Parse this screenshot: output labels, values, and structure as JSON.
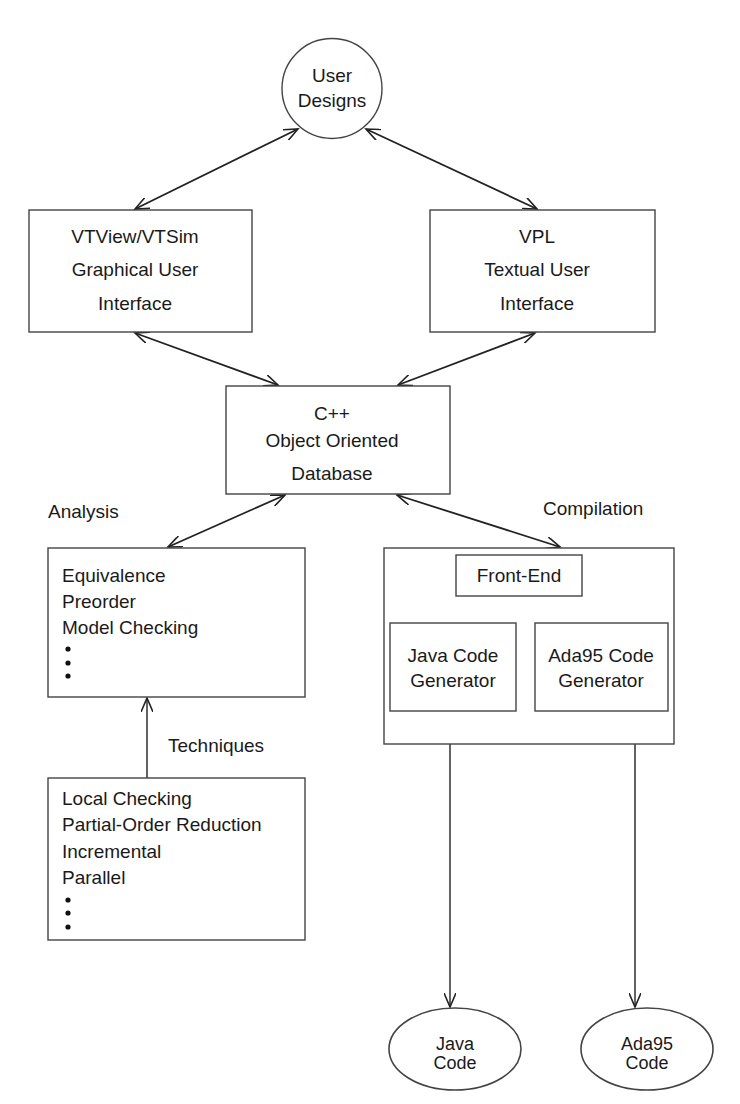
{
  "nodes": {
    "user_designs": {
      "lines": [
        "User",
        "Designs"
      ],
      "shape": "circle"
    },
    "gui": {
      "lines": [
        "VTView/VTSim",
        "Graphical User",
        "Interface"
      ],
      "shape": "box"
    },
    "tui": {
      "lines": [
        "VPL",
        "Textual User",
        "Interface"
      ],
      "shape": "box"
    },
    "database": {
      "lines": [
        "C++",
        "Object Oriented",
        "Database"
      ],
      "shape": "box"
    },
    "analysis": {
      "label": "Analysis",
      "items": [
        "Equivalence",
        "Preorder",
        "Model Checking"
      ],
      "ellipsis": true
    },
    "techniques": {
      "label": "Techniques",
      "items": [
        "Local Checking",
        "Partial-Order Reduction",
        "Incremental",
        "Parallel"
      ],
      "ellipsis": true
    },
    "compilation": {
      "label": "Compilation"
    },
    "front_end": {
      "lines": [
        "Front-End"
      ]
    },
    "java_gen": {
      "lines": [
        "Java Code",
        "Generator"
      ]
    },
    "ada_gen": {
      "lines": [
        "Ada95 Code",
        "Generator"
      ]
    },
    "java_code": {
      "lines": [
        "Java",
        "Code"
      ],
      "shape": "ellipse"
    },
    "ada_code": {
      "lines": [
        "Ada95",
        "Code"
      ],
      "shape": "ellipse"
    }
  },
  "edges": [
    {
      "from": "user_designs",
      "to": "gui",
      "type": "bidirectional"
    },
    {
      "from": "user_designs",
      "to": "tui",
      "type": "bidirectional"
    },
    {
      "from": "gui",
      "to": "database",
      "type": "bidirectional"
    },
    {
      "from": "tui",
      "to": "database",
      "type": "bidirectional"
    },
    {
      "from": "database",
      "to": "analysis",
      "type": "bidirectional"
    },
    {
      "from": "database",
      "to": "compilation",
      "type": "bidirectional"
    },
    {
      "from": "techniques",
      "to": "analysis",
      "type": "directed"
    },
    {
      "from": "front_end",
      "to": "java_gen",
      "type": "line"
    },
    {
      "from": "front_end",
      "to": "ada_gen",
      "type": "line"
    },
    {
      "from": "compilation",
      "to": "java_code",
      "type": "directed"
    },
    {
      "from": "compilation",
      "to": "ada_code",
      "type": "directed"
    }
  ],
  "colors": {
    "stroke": "#222222",
    "background": "#ffffff",
    "text": "#1a1a1a"
  }
}
